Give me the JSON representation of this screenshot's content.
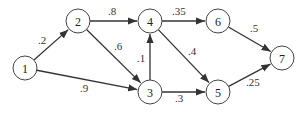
{
  "diagram": {
    "type": "directed-weighted-graph",
    "nodes": [
      {
        "id": "1",
        "label": "1",
        "x": 25,
        "y": 68
      },
      {
        "id": "2",
        "label": "2",
        "x": 78,
        "y": 21
      },
      {
        "id": "3",
        "label": "3",
        "x": 150,
        "y": 92
      },
      {
        "id": "4",
        "label": "4",
        "x": 150,
        "y": 21
      },
      {
        "id": "5",
        "label": "5",
        "x": 218,
        "y": 92
      },
      {
        "id": "6",
        "label": "6",
        "x": 218,
        "y": 21
      },
      {
        "id": "7",
        "label": "7",
        "x": 282,
        "y": 58
      }
    ],
    "edges": [
      {
        "from": "1",
        "to": "2",
        "weight": ".2",
        "lx": 38,
        "ly": 44
      },
      {
        "from": "1",
        "to": "3",
        "weight": ".9",
        "lx": 80,
        "ly": 92
      },
      {
        "from": "2",
        "to": "4",
        "weight": ".8",
        "lx": 108,
        "ly": 15
      },
      {
        "from": "2",
        "to": "3",
        "weight": ".6",
        "lx": 114,
        "ly": 50
      },
      {
        "from": "3",
        "to": "4",
        "weight": ".1",
        "lx": 137,
        "ly": 62
      },
      {
        "from": "4",
        "to": "6",
        "weight": ".35",
        "lx": 172,
        "ly": 15
      },
      {
        "from": "4",
        "to": "5",
        "weight": ".4",
        "lx": 188,
        "ly": 55
      },
      {
        "from": "3",
        "to": "5",
        "weight": ".3",
        "lx": 175,
        "ly": 102
      },
      {
        "from": "6",
        "to": "7",
        "weight": ".5",
        "lx": 250,
        "ly": 32
      },
      {
        "from": "5",
        "to": "7",
        "weight": ".25",
        "lx": 246,
        "ly": 86
      }
    ]
  }
}
